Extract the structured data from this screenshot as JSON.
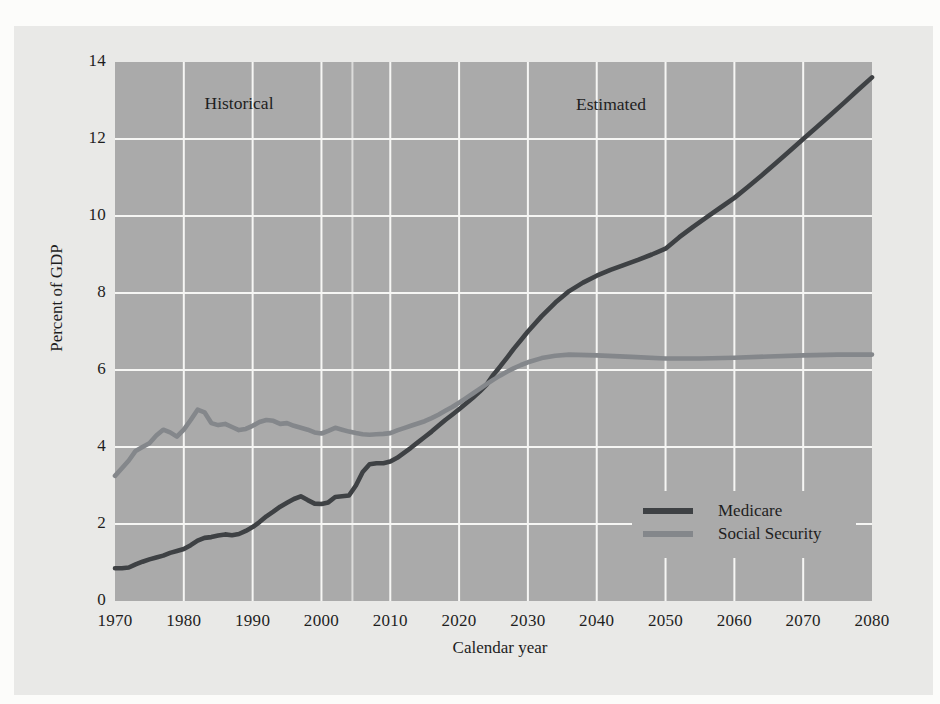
{
  "figure": {
    "y_axis_title": "Percent of GDP",
    "x_axis_title": "Calendar year",
    "region_labels": {
      "historical": "Historical",
      "estimated": "Estimated"
    }
  },
  "legend": {
    "items": [
      {
        "label": "Medicare",
        "color": "#3e4144"
      },
      {
        "label": "Social Security",
        "color": "#84878b"
      }
    ]
  },
  "colors": {
    "page_background": "#fcfcfa",
    "panel_background": "#e9e9e7",
    "plot_background": "#aaaaaa",
    "gridline": "#f6f6f4",
    "divider_line": "rgba(248,248,246,0.65)",
    "text": "#1e1e1e"
  },
  "chart_data": {
    "type": "line",
    "title": "",
    "xlabel": "Calendar year",
    "ylabel": "Percent of GDP",
    "xlim": [
      1970,
      2080
    ],
    "ylim": [
      0,
      14
    ],
    "x_ticks": [
      1970,
      1980,
      1990,
      2000,
      2010,
      2020,
      2030,
      2040,
      2050,
      2060,
      2070,
      2080
    ],
    "y_ticks": [
      0,
      2,
      4,
      6,
      8,
      10,
      12,
      14
    ],
    "grid": true,
    "gridline_color_is_white": true,
    "legend_position": "lower right",
    "annotations": [
      "Historical",
      "Estimated"
    ],
    "divider_year": 2004.5,
    "series": [
      {
        "name": "Medicare",
        "color": "#3e4144",
        "points": [
          [
            1970,
            0.85
          ],
          [
            1971,
            0.85
          ],
          [
            1972,
            0.87
          ],
          [
            1973,
            0.95
          ],
          [
            1974,
            1.02
          ],
          [
            1975,
            1.08
          ],
          [
            1976,
            1.13
          ],
          [
            1977,
            1.18
          ],
          [
            1978,
            1.25
          ],
          [
            1979,
            1.3
          ],
          [
            1980,
            1.35
          ],
          [
            1981,
            1.45
          ],
          [
            1982,
            1.57
          ],
          [
            1983,
            1.64
          ],
          [
            1984,
            1.66
          ],
          [
            1985,
            1.7
          ],
          [
            1986,
            1.73
          ],
          [
            1987,
            1.71
          ],
          [
            1988,
            1.74
          ],
          [
            1989,
            1.82
          ],
          [
            1990,
            1.92
          ],
          [
            1991,
            2.05
          ],
          [
            1992,
            2.2
          ],
          [
            1993,
            2.32
          ],
          [
            1994,
            2.45
          ],
          [
            1995,
            2.55
          ],
          [
            1996,
            2.65
          ],
          [
            1997,
            2.72
          ],
          [
            1998,
            2.62
          ],
          [
            1999,
            2.53
          ],
          [
            2000,
            2.52
          ],
          [
            2001,
            2.56
          ],
          [
            2002,
            2.7
          ],
          [
            2003,
            2.72
          ],
          [
            2004,
            2.74
          ],
          [
            2005,
            3.0
          ],
          [
            2006,
            3.35
          ],
          [
            2007,
            3.55
          ],
          [
            2008,
            3.58
          ],
          [
            2009,
            3.58
          ],
          [
            2010,
            3.62
          ],
          [
            2011,
            3.72
          ],
          [
            2012,
            3.85
          ],
          [
            2013,
            3.98
          ],
          [
            2014,
            4.12
          ],
          [
            2015,
            4.26
          ],
          [
            2016,
            4.4
          ],
          [
            2017,
            4.55
          ],
          [
            2018,
            4.7
          ],
          [
            2019,
            4.84
          ],
          [
            2020,
            4.98
          ],
          [
            2021,
            5.13
          ],
          [
            2022,
            5.28
          ],
          [
            2023,
            5.44
          ],
          [
            2024,
            5.62
          ],
          [
            2025,
            5.88
          ],
          [
            2026,
            6.1
          ],
          [
            2027,
            6.33
          ],
          [
            2028,
            6.56
          ],
          [
            2029,
            6.78
          ],
          [
            2030,
            7.0
          ],
          [
            2032,
            7.4
          ],
          [
            2034,
            7.75
          ],
          [
            2036,
            8.05
          ],
          [
            2038,
            8.27
          ],
          [
            2040,
            8.45
          ],
          [
            2042,
            8.6
          ],
          [
            2044,
            8.73
          ],
          [
            2046,
            8.86
          ],
          [
            2048,
            9.0
          ],
          [
            2050,
            9.15
          ],
          [
            2052,
            9.45
          ],
          [
            2054,
            9.72
          ],
          [
            2056,
            9.97
          ],
          [
            2058,
            10.22
          ],
          [
            2060,
            10.47
          ],
          [
            2062,
            10.76
          ],
          [
            2064,
            11.06
          ],
          [
            2066,
            11.37
          ],
          [
            2068,
            11.68
          ],
          [
            2070,
            12.0
          ],
          [
            2072,
            12.31
          ],
          [
            2074,
            12.63
          ],
          [
            2076,
            12.95
          ],
          [
            2078,
            13.28
          ],
          [
            2080,
            13.6
          ]
        ]
      },
      {
        "name": "Social Security",
        "color": "#84878b",
        "points": [
          [
            1970,
            3.25
          ],
          [
            1971,
            3.45
          ],
          [
            1972,
            3.65
          ],
          [
            1973,
            3.9
          ],
          [
            1974,
            4.0
          ],
          [
            1975,
            4.1
          ],
          [
            1976,
            4.3
          ],
          [
            1977,
            4.45
          ],
          [
            1978,
            4.38
          ],
          [
            1979,
            4.27
          ],
          [
            1980,
            4.45
          ],
          [
            1981,
            4.7
          ],
          [
            1982,
            4.97
          ],
          [
            1983,
            4.9
          ],
          [
            1984,
            4.62
          ],
          [
            1985,
            4.57
          ],
          [
            1986,
            4.6
          ],
          [
            1987,
            4.52
          ],
          [
            1988,
            4.44
          ],
          [
            1989,
            4.47
          ],
          [
            1990,
            4.55
          ],
          [
            1991,
            4.65
          ],
          [
            1992,
            4.7
          ],
          [
            1993,
            4.68
          ],
          [
            1994,
            4.6
          ],
          [
            1995,
            4.62
          ],
          [
            1996,
            4.55
          ],
          [
            1997,
            4.5
          ],
          [
            1998,
            4.45
          ],
          [
            1999,
            4.38
          ],
          [
            2000,
            4.35
          ],
          [
            2001,
            4.42
          ],
          [
            2002,
            4.5
          ],
          [
            2003,
            4.45
          ],
          [
            2004,
            4.4
          ],
          [
            2005,
            4.36
          ],
          [
            2006,
            4.33
          ],
          [
            2007,
            4.32
          ],
          [
            2008,
            4.33
          ],
          [
            2009,
            4.34
          ],
          [
            2010,
            4.36
          ],
          [
            2011,
            4.43
          ],
          [
            2012,
            4.49
          ],
          [
            2013,
            4.55
          ],
          [
            2014,
            4.61
          ],
          [
            2015,
            4.67
          ],
          [
            2016,
            4.75
          ],
          [
            2017,
            4.84
          ],
          [
            2018,
            4.94
          ],
          [
            2019,
            5.04
          ],
          [
            2020,
            5.15
          ],
          [
            2021,
            5.27
          ],
          [
            2022,
            5.39
          ],
          [
            2023,
            5.51
          ],
          [
            2024,
            5.63
          ],
          [
            2025,
            5.75
          ],
          [
            2026,
            5.86
          ],
          [
            2027,
            5.96
          ],
          [
            2028,
            6.05
          ],
          [
            2029,
            6.13
          ],
          [
            2030,
            6.2
          ],
          [
            2032,
            6.31
          ],
          [
            2034,
            6.37
          ],
          [
            2036,
            6.4
          ],
          [
            2040,
            6.38
          ],
          [
            2045,
            6.34
          ],
          [
            2050,
            6.3
          ],
          [
            2055,
            6.3
          ],
          [
            2060,
            6.32
          ],
          [
            2065,
            6.35
          ],
          [
            2070,
            6.38
          ],
          [
            2075,
            6.4
          ],
          [
            2080,
            6.4
          ]
        ]
      }
    ]
  }
}
